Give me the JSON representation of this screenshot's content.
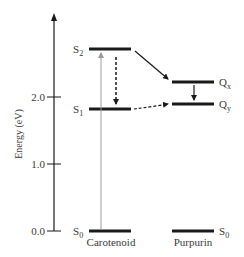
{
  "diagram": {
    "type": "energy-level-diagram",
    "axis": {
      "label": "Energy (eV)",
      "ticks": [
        {
          "value": 0.0,
          "label": "0.0",
          "y": 231
        },
        {
          "value": 1.0,
          "label": "1.0",
          "y": 164
        },
        {
          "value": 2.0,
          "label": "2.0",
          "y": 97
        }
      ]
    },
    "molecules": [
      {
        "name": "Carotenoid",
        "label": "Carotenoid",
        "levels": [
          {
            "state": "S0",
            "base": "S",
            "sub": "0",
            "energy_eV": 0.0
          },
          {
            "state": "S1",
            "base": "S",
            "sub": "1",
            "energy_eV": 1.82
          },
          {
            "state": "S2",
            "base": "S",
            "sub": "2",
            "energy_eV": 2.7
          }
        ]
      },
      {
        "name": "Purpurin",
        "label": "Purpurin",
        "levels": [
          {
            "state": "S0",
            "base": "S",
            "sub": "0",
            "energy_eV": 0.0
          },
          {
            "state": "Qy",
            "base": "Q",
            "sub": "y",
            "energy_eV": 1.9
          },
          {
            "state": "Qx",
            "base": "Q",
            "sub": "x",
            "energy_eV": 2.22
          }
        ]
      }
    ],
    "transitions": [
      {
        "from": "Carotenoid S0",
        "to": "Carotenoid S2",
        "style": "solid gray arrow",
        "meaning": "absorption"
      },
      {
        "from": "Carotenoid S2",
        "to": "Carotenoid S1",
        "style": "dashed black arrow",
        "meaning": "internal conversion"
      },
      {
        "from": "Carotenoid S2",
        "to": "Purpurin Qx",
        "style": "solid black arrow",
        "meaning": "energy transfer"
      },
      {
        "from": "Carotenoid S1",
        "to": "Purpurin Qy",
        "style": "dashed black arrow",
        "meaning": "energy transfer"
      },
      {
        "from": "Purpurin Qx",
        "to": "Purpurin Qy",
        "style": "solid black arrow",
        "meaning": "relaxation"
      }
    ]
  },
  "labels": {
    "axis_title": "Energy (eV)",
    "tick_0": "0.0",
    "tick_1": "1.0",
    "tick_2": "2.0",
    "S2_base": "S",
    "S2_sub": "2",
    "S1_base": "S",
    "S1_sub": "1",
    "S0c_base": "S",
    "S0c_sub": "0",
    "Qx_base": "Q",
    "Qx_sub": "x",
    "Qy_base": "Q",
    "Qy_sub": "y",
    "S0p_base": "S",
    "S0p_sub": "0",
    "carotenoid": "Carotenoid",
    "purpurin": "Purpurin"
  },
  "colors": {
    "line": "#1a1a1a",
    "absorption_arrow": "#9a9a9a",
    "text": "#3a3a3a"
  }
}
